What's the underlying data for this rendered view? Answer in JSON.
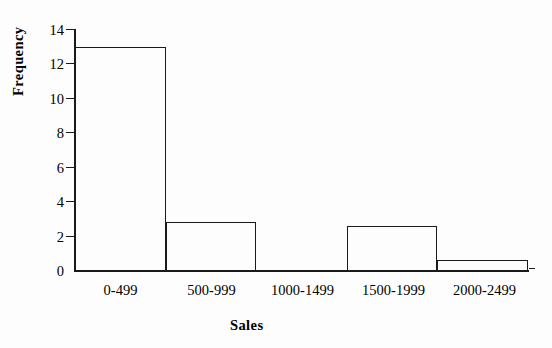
{
  "chart_data": {
    "type": "bar",
    "title": "",
    "xlabel": "Sales",
    "ylabel": "Frequency",
    "categories": [
      "0-499",
      "500-999",
      "1000-1499",
      "1500-1999",
      "2000-2499"
    ],
    "values": [
      13,
      2.8,
      0,
      2.6,
      0.6
    ],
    "ylim": [
      0,
      14
    ],
    "ytick_labels": [
      "14",
      "12",
      "10",
      "8",
      "6",
      "4",
      "2",
      "0"
    ],
    "ytick_values": [
      14,
      12,
      10,
      8,
      6,
      4,
      2,
      0
    ],
    "grid": false,
    "legend": "none",
    "bar_style": "outline",
    "bar_fill_color": "#ffffff",
    "bar_edge_color": "#1a1a1a",
    "axis_color": "#1a1a1a",
    "background_color": "#ffffff"
  }
}
